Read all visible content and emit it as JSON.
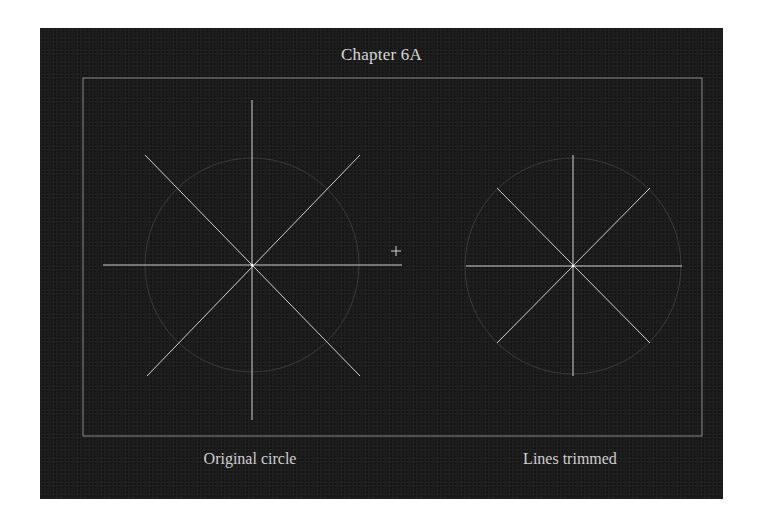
{
  "figure": {
    "title": "Chapter 6A",
    "captions": {
      "left": "Original circle",
      "right": "Lines trimmed"
    },
    "colors": {
      "background": "#1c1c1c",
      "lines": "#cfcfcf",
      "circle": "#3a3a3a",
      "frame": "#8a8a8a",
      "text": "#d8d8d8"
    },
    "cursor_icon": "crosshair-icon"
  }
}
